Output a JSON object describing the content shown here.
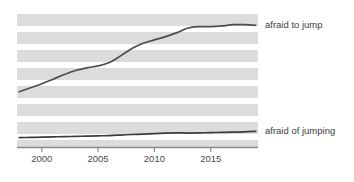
{
  "chart_data": {
    "type": "line",
    "title": "",
    "subtitle": "",
    "xlabel": "",
    "ylabel": "",
    "xlim": [
      1997.8,
      2019.2
    ],
    "ylim": [
      0,
      100
    ],
    "grid": "horizontal-banding",
    "legend_position": "right-inline",
    "xticks": [
      2000,
      2005,
      2010,
      2015
    ],
    "xtick_labels": [
      "2000",
      "2005",
      "2010",
      "2015"
    ],
    "yticks": [],
    "ytick_labels": [],
    "x": [
      1998,
      1999,
      2000,
      2001,
      2002,
      2003,
      2004,
      2005,
      2006,
      2007,
      2008,
      2009,
      2010,
      2011,
      2012,
      2013,
      2014,
      2015,
      2016,
      2017,
      2018,
      2019
    ],
    "series": [
      {
        "name": "afraid to jump",
        "color": "#4d4d4d",
        "label_anchor_year": 2019,
        "values": [
          41.5,
          44.5,
          47.5,
          51.0,
          54.5,
          57.5,
          59.5,
          61.0,
          63.5,
          68.5,
          74.0,
          78.0,
          80.5,
          83.0,
          86.0,
          89.5,
          90.5,
          90.5,
          91.0,
          92.0,
          92.0,
          91.5
        ]
      },
      {
        "name": "afraid of jumping",
        "color": "#3c3c3c",
        "label_anchor_year": 2019,
        "values": [
          7.0,
          7.2,
          7.4,
          7.6,
          7.8,
          8.0,
          8.2,
          8.4,
          8.6,
          9.0,
          9.4,
          9.7,
          10.0,
          10.4,
          10.6,
          10.5,
          10.6,
          10.8,
          11.0,
          11.2,
          11.4,
          11.8
        ]
      }
    ],
    "band_color": "#dcdcdc",
    "band_background": "#ffffff",
    "axis_color": "#8a8a8a",
    "tick_color": "#8a8a8a"
  },
  "labels": {
    "series_top": "afraid to jump",
    "series_bottom": "afraid of jumping"
  },
  "axis": {
    "tick_2000": "2000",
    "tick_2005": "2005",
    "tick_2010": "2010",
    "tick_2015": "2015"
  }
}
